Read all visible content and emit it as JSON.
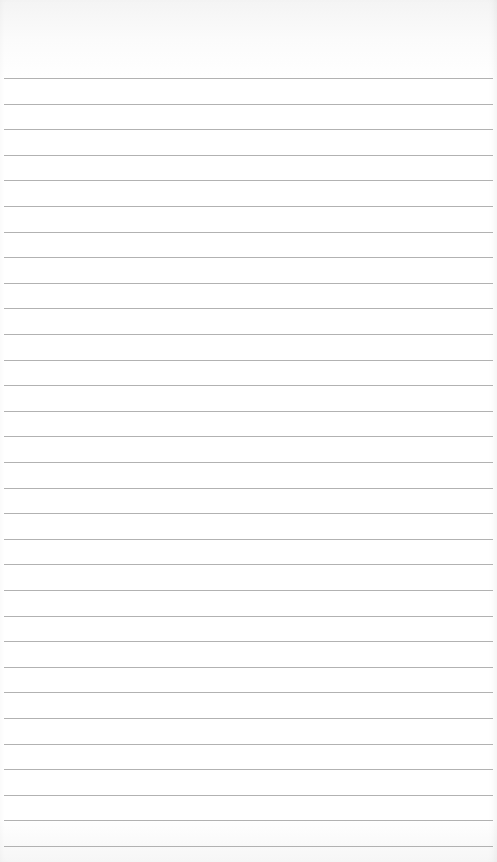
{
  "page": {
    "type": "blank ruled notebook paper",
    "background_color": "#ffffff",
    "rule_color": "#a4a4a4"
  },
  "rules": {
    "count": 31,
    "first_y": 78,
    "spacing": 25.6,
    "left": 4,
    "right": 493
  }
}
